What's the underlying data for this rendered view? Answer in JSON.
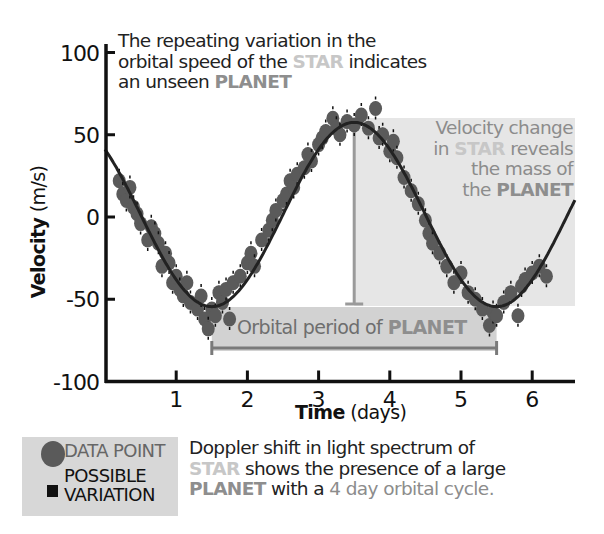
{
  "chart_data": {
    "type": "scatter",
    "title": "",
    "xlabel_bold": "Time",
    "xlabel_unit": "(days)",
    "ylabel_bold": "Velocity",
    "ylabel_unit": "(m/s)",
    "xlim": [
      0,
      6.6
    ],
    "ylim": [
      -100,
      100
    ],
    "x_ticks": [
      1,
      2,
      3,
      4,
      5,
      6
    ],
    "y_ticks": [
      100,
      50,
      0,
      -50,
      -100
    ],
    "grid": false,
    "fit_curve": {
      "type": "sine",
      "period_days": 4,
      "amplitude": 56,
      "offset": 1.5,
      "peak_day": 3.5,
      "trough_days": [
        1.5,
        5.5
      ]
    },
    "series": [
      {
        "name": "DATA POINT",
        "points": [
          [
            0.2,
            22
          ],
          [
            0.25,
            14
          ],
          [
            0.3,
            10
          ],
          [
            0.35,
            18
          ],
          [
            0.4,
            6
          ],
          [
            0.45,
            2
          ],
          [
            0.5,
            -4
          ],
          [
            0.6,
            -14
          ],
          [
            0.65,
            -6
          ],
          [
            0.7,
            -10
          ],
          [
            0.75,
            -16
          ],
          [
            0.8,
            -30
          ],
          [
            0.85,
            -22
          ],
          [
            0.9,
            -28
          ],
          [
            0.95,
            -40
          ],
          [
            1.0,
            -36
          ],
          [
            1.05,
            -44
          ],
          [
            1.1,
            -48
          ],
          [
            1.15,
            -40
          ],
          [
            1.2,
            -52
          ],
          [
            1.3,
            -56
          ],
          [
            1.35,
            -48
          ],
          [
            1.4,
            -62
          ],
          [
            1.45,
            -68
          ],
          [
            1.5,
            -56
          ],
          [
            1.55,
            -60
          ],
          [
            1.6,
            -46
          ],
          [
            1.65,
            -52
          ],
          [
            1.7,
            -44
          ],
          [
            1.75,
            -62
          ],
          [
            1.8,
            -40
          ],
          [
            1.9,
            -36
          ],
          [
            2.0,
            -28
          ],
          [
            2.05,
            -22
          ],
          [
            2.1,
            -30
          ],
          [
            2.2,
            -14
          ],
          [
            2.3,
            -8
          ],
          [
            2.35,
            -2
          ],
          [
            2.4,
            4
          ],
          [
            2.5,
            10
          ],
          [
            2.55,
            14
          ],
          [
            2.6,
            22
          ],
          [
            2.65,
            18
          ],
          [
            2.7,
            26
          ],
          [
            2.8,
            30
          ],
          [
            2.85,
            38
          ],
          [
            2.9,
            34
          ],
          [
            3.0,
            44
          ],
          [
            3.05,
            48
          ],
          [
            3.1,
            52
          ],
          [
            3.2,
            60
          ],
          [
            3.25,
            54
          ],
          [
            3.3,
            50
          ],
          [
            3.4,
            58
          ],
          [
            3.5,
            56
          ],
          [
            3.6,
            62
          ],
          [
            3.7,
            54
          ],
          [
            3.8,
            66
          ],
          [
            3.85,
            48
          ],
          [
            3.9,
            50
          ],
          [
            4.0,
            40
          ],
          [
            4.05,
            46
          ],
          [
            4.1,
            36
          ],
          [
            4.2,
            24
          ],
          [
            4.3,
            16
          ],
          [
            4.4,
            8
          ],
          [
            4.5,
            -2
          ],
          [
            4.55,
            -10
          ],
          [
            4.6,
            -16
          ],
          [
            4.7,
            -22
          ],
          [
            4.8,
            -30
          ],
          [
            4.9,
            -40
          ],
          [
            5.0,
            -34
          ],
          [
            5.1,
            -46
          ],
          [
            5.2,
            -50
          ],
          [
            5.3,
            -56
          ],
          [
            5.4,
            -66
          ],
          [
            5.45,
            -58
          ],
          [
            5.5,
            -60
          ],
          [
            5.6,
            -52
          ],
          [
            5.7,
            -46
          ],
          [
            5.8,
            -60
          ],
          [
            5.85,
            -42
          ],
          [
            5.9,
            -38
          ],
          [
            6.0,
            -34
          ],
          [
            6.1,
            -30
          ],
          [
            6.2,
            -36
          ]
        ]
      }
    ],
    "annotations": [
      {
        "text": "The repeating variation in the orbital speed of the STAR indicates an unseen PLANET",
        "position": "top-left"
      },
      {
        "text": "Velocity change in STAR reveals the mass of the PLANET",
        "region_x": [
          3.5,
          6.6
        ],
        "region_y": [
          -55,
          58
        ]
      },
      {
        "text": "Orbital period of PLANET",
        "bracket_x": [
          1.5,
          5.5
        ]
      }
    ],
    "legend": [
      {
        "label": "DATA POINT",
        "marker": "circle"
      },
      {
        "label": "POSSIBLE VARIATION",
        "marker": "square"
      }
    ]
  },
  "captions": {
    "top": {
      "line1": "The  repeating variation in the",
      "line2a": "orbital speed of the ",
      "star": "STAR",
      "line2b": " indicates",
      "line3a": "an unseen ",
      "planet": "PLANET"
    },
    "velocity": {
      "line1": "Velocity change",
      "line2a": "in ",
      "star": "STAR",
      "line2b": " reveals",
      "line3": "the mass of",
      "line4a": "the ",
      "planet": "PLANET"
    },
    "period": {
      "text": "Orbital period of ",
      "planet": "PLANET"
    },
    "bottom": {
      "line1": "Doppler shift in light spectrum of",
      "star": "STAR",
      "line2b": " shows the presence of a large",
      "planet": "PLANET",
      "line3b": " with a ",
      "days": "4 day orbital cycle."
    }
  },
  "legend": {
    "data_point": "DATA POINT",
    "possible_line1": "POSSIBLE",
    "possible_line2": "VARIATION"
  },
  "colors": {
    "axis": "#111111",
    "curve": "#222222",
    "dot": "#5a5a5a",
    "errbar": "#111111",
    "shade": "#e6e6e6",
    "period_shade": "#d2d2d2",
    "marker_line": "#9a9a9a",
    "star": "#c7c7c7",
    "planet": "#8e8e8e"
  }
}
